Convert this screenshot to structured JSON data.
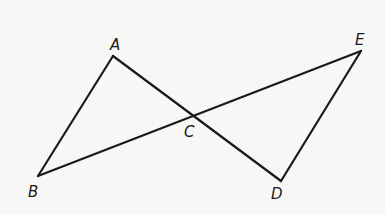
{
  "diagram": {
    "type": "geometry",
    "colors": {
      "background": "#f7f7f6",
      "stroke": "#1a1a1a"
    },
    "points": {
      "A": {
        "label": "A",
        "x": 113,
        "y": 56,
        "label_x": 110,
        "label_y": 50
      },
      "B": {
        "label": "B",
        "x": 38,
        "y": 176,
        "label_x": 28,
        "label_y": 197
      },
      "C": {
        "label": "C",
        "x": 193,
        "y": 116,
        "label_x": 184,
        "label_y": 137
      },
      "D": {
        "label": "D",
        "x": 281,
        "y": 181,
        "label_x": 271,
        "label_y": 199
      },
      "E": {
        "label": "E",
        "x": 361,
        "y": 51,
        "label_x": 355,
        "label_y": 45
      }
    },
    "segments": [
      {
        "from": "A",
        "to": "B"
      },
      {
        "from": "A",
        "to": "D"
      },
      {
        "from": "B",
        "to": "E"
      },
      {
        "from": "E",
        "to": "D"
      }
    ]
  }
}
